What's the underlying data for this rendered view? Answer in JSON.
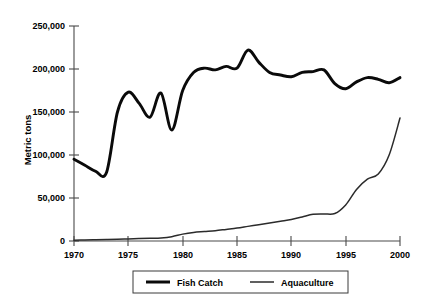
{
  "chart_data": {
    "type": "line",
    "title": "",
    "xlabel": "",
    "ylabel": "Metric tons",
    "xlim": [
      1970,
      2000
    ],
    "ylim": [
      0,
      250000
    ],
    "grid": false,
    "legend_position": "bottom-center",
    "x_ticks": [
      "1970",
      "1975",
      "1980",
      "1985",
      "1990",
      "1995",
      "2000"
    ],
    "x_tick_values": [
      1970,
      1975,
      1980,
      1985,
      1990,
      1995,
      2000
    ],
    "y_ticks": [
      "0",
      "50,000",
      "100,000",
      "150,000",
      "200,000",
      "250,000"
    ],
    "y_tick_values": [
      0,
      50000,
      100000,
      150000,
      200000,
      250000
    ],
    "x": [
      1970,
      1971,
      1972,
      1973,
      1974,
      1975,
      1976,
      1977,
      1978,
      1979,
      1980,
      1981,
      1982,
      1983,
      1984,
      1985,
      1986,
      1987,
      1988,
      1989,
      1990,
      1991,
      1992,
      1993,
      1994,
      1995,
      1996,
      1997,
      1998,
      1999,
      2000
    ],
    "series": [
      {
        "name": "Fish Catch",
        "color": "#0a0a0a",
        "values": [
          95000,
          88000,
          81000,
          80000,
          150000,
          173000,
          160000,
          144000,
          172000,
          129000,
          175000,
          196000,
          201000,
          199000,
          203000,
          201000,
          222000,
          208000,
          196000,
          193000,
          191000,
          196000,
          197000,
          199000,
          183000,
          177000,
          185000,
          190000,
          188000,
          184000,
          190000
        ]
      },
      {
        "name": "Aquaculture",
        "color": "#2b2b2b",
        "values": [
          1000,
          1200,
          1500,
          1800,
          2000,
          2400,
          2800,
          3200,
          3600,
          5000,
          8000,
          10000,
          11000,
          12000,
          13500,
          15000,
          17000,
          19000,
          21000,
          23000,
          25000,
          28000,
          31000,
          31500,
          32000,
          42000,
          60000,
          72000,
          78000,
          100000,
          143000
        ]
      }
    ],
    "annotations": []
  },
  "legend": {
    "items": [
      {
        "label": "Fish Catch"
      },
      {
        "label": "Aquaculture"
      }
    ]
  }
}
